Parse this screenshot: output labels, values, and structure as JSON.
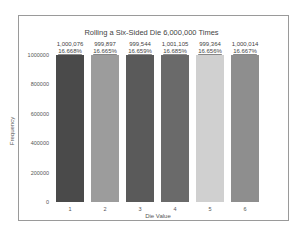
{
  "chart_data": {
    "type": "bar",
    "title": "Rolling a Six-Sided Die 6,000,000 Times",
    "xlabel": "Die Value",
    "ylabel": "Frequency",
    "categories": [
      "1",
      "2",
      "3",
      "4",
      "5",
      "6"
    ],
    "values": [
      1000076,
      999897,
      999544,
      1001105,
      999364,
      1000014
    ],
    "value_labels": [
      "1,000,076",
      "999,897",
      "999,544",
      "1,001,105",
      "999,364",
      "1,000,014"
    ],
    "percent_labels": [
      "16.668%",
      "16.665%",
      "16.659%",
      "16.685%",
      "16.656%",
      "16.667%"
    ],
    "colors": [
      "#4a4a4a",
      "#9c9c9c",
      "#5a5a5a",
      "#6a6a6a",
      "#d0d0d0",
      "#8e8e8e"
    ],
    "yticks": [
      0,
      200000,
      400000,
      600000,
      800000,
      1000000
    ],
    "ytick_labels": [
      "0",
      "200000",
      "400000",
      "600000",
      "800000",
      "1000000"
    ],
    "ylim": [
      0,
      1000000
    ],
    "grid": false,
    "legend": null
  }
}
